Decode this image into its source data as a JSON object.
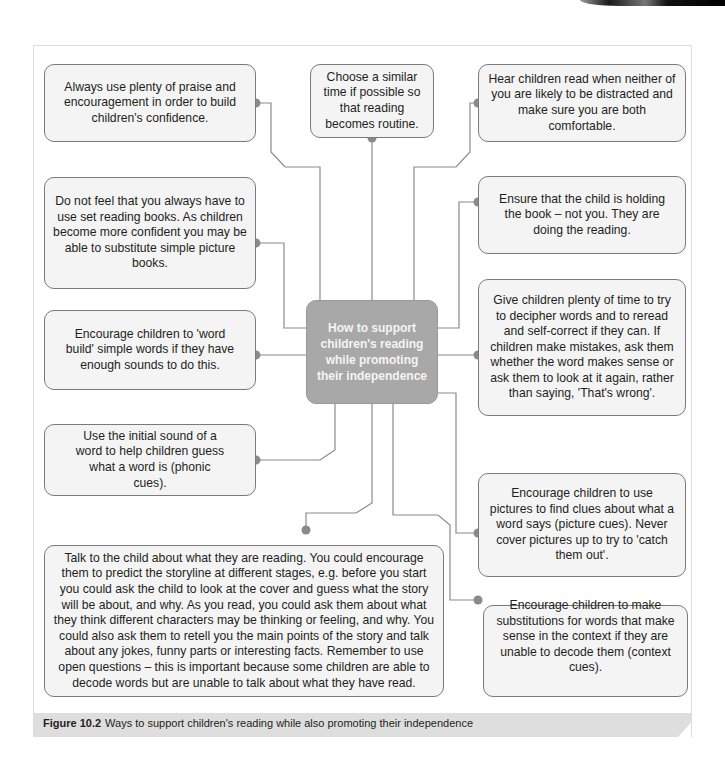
{
  "diagram": {
    "center": {
      "title": "How to support children's reading while promoting their independence",
      "fill_color": "#a8a8a8",
      "text_color": "#f4f4f4"
    },
    "nodes": [
      {
        "id": "praise",
        "position": "top-left",
        "text": "Always use plenty of praise and encouragement in order to build children's confidence."
      },
      {
        "id": "similar-time",
        "position": "top-center",
        "text": "Choose a similar time if possible so that reading becomes routine."
      },
      {
        "id": "not-distracted",
        "position": "top-right",
        "text": "Hear children read when neither of you are likely to be distracted and make sure you are both comfortable."
      },
      {
        "id": "set-books",
        "position": "left-upper",
        "text": "Do not feel that you always have to use set reading books. As children become more confident you may be able to substitute simple picture books."
      },
      {
        "id": "holding-book",
        "position": "right-upper",
        "text": "Ensure that the child is holding the book – not you. They are doing the reading."
      },
      {
        "id": "word-build",
        "position": "left-middle",
        "text": "Encourage children to 'word build' simple words if they have enough sounds to do this."
      },
      {
        "id": "time-to-decipher",
        "position": "right-middle",
        "text": "Give children plenty of time to try to decipher words and to reread and self-correct if they can. If children make mistakes, ask them whether the word makes sense or ask them to look at it again, rather than saying, 'That's wrong'."
      },
      {
        "id": "initial-sound",
        "position": "left-lower",
        "text": "Use the initial sound of a word to help children guess what a word is (phonic cues)."
      },
      {
        "id": "picture-cues",
        "position": "right-lower",
        "text": "Encourage children to use pictures to find clues about what a word says (picture cues). Never cover pictures up to try to 'catch them out'."
      },
      {
        "id": "talk-about-reading",
        "position": "bottom-left",
        "text": "Talk to the child about what they are reading. You could encourage them to predict the storyline at different stages, e.g. before you start you could ask the child to look at the cover and guess what the story will be about, and why. As you read, you could ask them about what they think different characters may be thinking or feeling, and why. You could also ask them to retell you the main points of the story and talk about any jokes, funny parts or interesting facts. Remember to use open questions – this is important because some children are able to decode words but are unable to talk about what they have read."
      },
      {
        "id": "context-cues",
        "position": "bottom-right",
        "text": "Encourage children to make substitutions for words that make sense in the context if they are unable to decode them (context cues)."
      }
    ],
    "connector_color": "#8a8a8a",
    "node_fill": "#f4f4f4",
    "node_border": "#7a7a7a"
  },
  "caption": {
    "label": "Figure 10.2",
    "text": "Ways to support children's reading while also promoting their independence"
  }
}
